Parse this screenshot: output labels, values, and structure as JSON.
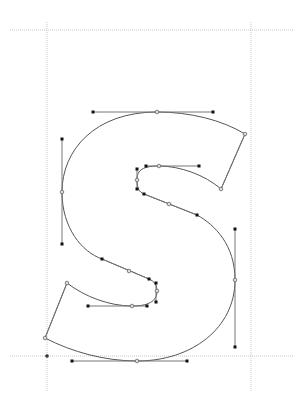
{
  "editor": {
    "glyph_name": "S",
    "colors": {
      "background": "#ffffff",
      "guide": "#c8c8c8",
      "outline": "#555555",
      "handle_line": "#777777",
      "node_fill": "#111111",
      "oncurve_fill": "#dddddd"
    },
    "guides": {
      "ascender_y": 30,
      "baseline_y": 356,
      "left_x": 47,
      "right_x": 251,
      "extent_top": 0,
      "extent_bottom": 392
    },
    "origin_marker": {
      "x": 47,
      "y": 356
    },
    "outline_path": "M245,134 C222,120 190,112 157,112 C95,112 62,150 62,192 C62,228 82,252 102,259 L149,279 C154,281 157,285 157,291 C157,299 152,306 132,306 C110,306 85,297 67,283 L45,338 C72,352 105,361 137,361 C192,361 235,328 235,280 C235,245 215,225 197,215 L144,194 C139,192 137,188 137,180 C137,172 140,166 159,166 C180,166 205,175 221,189 Z",
    "handles": [
      {
        "x1": 93,
        "y1": 112,
        "x2": 213,
        "y2": 112
      },
      {
        "x1": 62,
        "y1": 139,
        "x2": 62,
        "y2": 244
      },
      {
        "x1": 102,
        "y1": 259,
        "x2": 149,
        "y2": 279
      },
      {
        "x1": 156,
        "y1": 283,
        "x2": 156,
        "y2": 302
      },
      {
        "x1": 88,
        "y1": 306,
        "x2": 147,
        "y2": 306
      },
      {
        "x1": 72,
        "y1": 361,
        "x2": 187,
        "y2": 361
      },
      {
        "x1": 235,
        "y1": 229,
        "x2": 235,
        "y2": 347
      },
      {
        "x1": 144,
        "y1": 194,
        "x2": 197,
        "y2": 215
      },
      {
        "x1": 137,
        "y1": 169,
        "x2": 137,
        "y2": 189
      },
      {
        "x1": 146,
        "y1": 166,
        "x2": 199,
        "y2": 166
      },
      {
        "x1": 245,
        "y1": 134,
        "x2": 221,
        "y2": 189
      },
      {
        "x1": 67,
        "y1": 283,
        "x2": 45,
        "y2": 338
      }
    ],
    "offcurve_nodes": [
      {
        "x": 93,
        "y": 112
      },
      {
        "x": 213,
        "y": 112
      },
      {
        "x": 62,
        "y": 139
      },
      {
        "x": 62,
        "y": 244
      },
      {
        "x": 102,
        "y": 259
      },
      {
        "x": 149,
        "y": 279
      },
      {
        "x": 156,
        "y": 283
      },
      {
        "x": 156,
        "y": 302
      },
      {
        "x": 88,
        "y": 306
      },
      {
        "x": 147,
        "y": 306
      },
      {
        "x": 72,
        "y": 361
      },
      {
        "x": 187,
        "y": 361
      },
      {
        "x": 235,
        "y": 229
      },
      {
        "x": 235,
        "y": 347
      },
      {
        "x": 144,
        "y": 194
      },
      {
        "x": 197,
        "y": 215
      },
      {
        "x": 137,
        "y": 169
      },
      {
        "x": 137,
        "y": 189
      },
      {
        "x": 146,
        "y": 166
      },
      {
        "x": 199,
        "y": 166
      }
    ],
    "oncurve_nodes": [
      {
        "x": 157,
        "y": 112
      },
      {
        "x": 62,
        "y": 192
      },
      {
        "x": 129,
        "y": 271
      },
      {
        "x": 157,
        "y": 291
      },
      {
        "x": 132,
        "y": 306
      },
      {
        "x": 137,
        "y": 361
      },
      {
        "x": 235,
        "y": 280
      },
      {
        "x": 169,
        "y": 204
      },
      {
        "x": 137,
        "y": 180
      },
      {
        "x": 159,
        "y": 166
      },
      {
        "x": 221,
        "y": 189
      },
      {
        "x": 67,
        "y": 283
      },
      {
        "x": 45,
        "y": 338
      },
      {
        "x": 245,
        "y": 134
      }
    ]
  }
}
